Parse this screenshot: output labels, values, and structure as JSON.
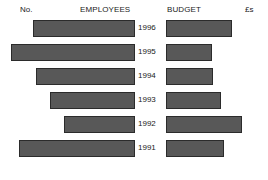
{
  "chart_data": {
    "type": "bar",
    "subtype": "butterfly-tornado-bidirectional",
    "title": "",
    "left_panel_label": "EMPLOYEES",
    "left_unit_label": "No.",
    "right_panel_label": "BUDGET",
    "right_unit_label": "£s",
    "categories": [
      "1996",
      "1995",
      "1994",
      "1993",
      "1992",
      "1991"
    ],
    "category_order": "descending-years-top-to-bottom",
    "xlabel": "",
    "ylabel": "",
    "grid": false,
    "legend": "none",
    "axis_ticks": "none",
    "series": [
      {
        "name": "EMPLOYEES",
        "unit": "No.",
        "direction": "left",
        "values": [
          102,
          124,
          99,
          85,
          71,
          116
        ],
        "max": 124
      },
      {
        "name": "BUDGET",
        "unit": "£s",
        "direction": "right",
        "values": [
          66,
          46,
          47,
          55,
          76,
          58
        ],
        "max": 76
      }
    ],
    "colors": {
      "bar_fill": "#585858",
      "bar_border": "#2b2b2b",
      "background": "#ffffff",
      "text": "#1a1a1a"
    }
  },
  "header": {
    "no_label": "No.",
    "employees_label": "EMPLOYEES",
    "budget_label": "BUDGET",
    "pounds_label": "£s"
  },
  "rows": [
    {
      "year": "1996",
      "employees": 102,
      "budget": 66
    },
    {
      "year": "1995",
      "employees": 124,
      "budget": 46
    },
    {
      "year": "1994",
      "employees": 99,
      "budget": 47
    },
    {
      "year": "1993",
      "employees": 85,
      "budget": 55
    },
    {
      "year": "1992",
      "employees": 71,
      "budget": 76
    },
    {
      "year": "1991",
      "employees": 116,
      "budget": 58
    }
  ]
}
